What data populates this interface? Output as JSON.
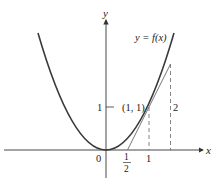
{
  "diagram": {
    "curve_label": "y = f(x)",
    "axis_x_label": "x",
    "axis_y_label": "y",
    "origin_label": "0",
    "point_label": "(1, 1)",
    "y_tick_label": "1",
    "x_tick_label_1": "1",
    "x_tick_half_num": "1",
    "x_tick_half_den": "2",
    "rise_label": "2",
    "colors": {
      "curve": "#3a3a3a",
      "axes": "#333333",
      "tangent": "#555555",
      "dashed": "#666666"
    }
  }
}
